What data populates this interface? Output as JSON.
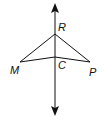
{
  "diagram": {
    "type": "geometry",
    "points": {
      "R": {
        "label": "R",
        "x": 55,
        "y": 34
      },
      "C": {
        "label": "C",
        "x": 55,
        "y": 57
      },
      "M": {
        "label": "M",
        "x": 20,
        "y": 62
      },
      "P": {
        "label": "P",
        "x": 90,
        "y": 62
      }
    },
    "line": {
      "label": "",
      "x": 55,
      "y_top": 4,
      "y_bottom": 115,
      "arrows": "both"
    },
    "segments": [
      [
        "R",
        "M"
      ],
      [
        "R",
        "P"
      ],
      [
        "M",
        "C"
      ],
      [
        "C",
        "P"
      ]
    ],
    "stroke_color": "#111111"
  }
}
